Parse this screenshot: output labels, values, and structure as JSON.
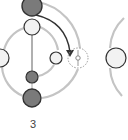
{
  "diagram": {
    "step_label": "3",
    "colors": {
      "ring": "#c4c4c4",
      "node_dark_fill": "#7a7a7a",
      "node_light_fill": "#f2f2f2",
      "node_stroke": "#333333",
      "arrow": "#333333",
      "dashed_target": "#999999"
    },
    "nodes": [
      {
        "id": "top-dark",
        "type": "dark",
        "cx": 32,
        "cy": 6,
        "r": 10
      },
      {
        "id": "upper-light",
        "type": "light",
        "cx": 32,
        "cy": 27,
        "r": 8
      },
      {
        "id": "left-light",
        "type": "light",
        "cx": 0,
        "cy": 58,
        "r": 9
      },
      {
        "id": "right-small-light",
        "type": "light",
        "cx": 56,
        "cy": 58,
        "r": 6
      },
      {
        "id": "lower-small-dark",
        "type": "dark",
        "cx": 32,
        "cy": 77,
        "r": 6
      },
      {
        "id": "bottom-dark",
        "type": "dark",
        "cx": 32,
        "cy": 98,
        "r": 9
      },
      {
        "id": "far-right-light",
        "type": "light",
        "cx": 116,
        "cy": 58,
        "r": 10
      }
    ],
    "target": {
      "id": "dashed-target",
      "cx": 78,
      "cy": 58,
      "r": 10
    },
    "arrow": {
      "from": "top-dark",
      "to": "dashed-target"
    }
  }
}
